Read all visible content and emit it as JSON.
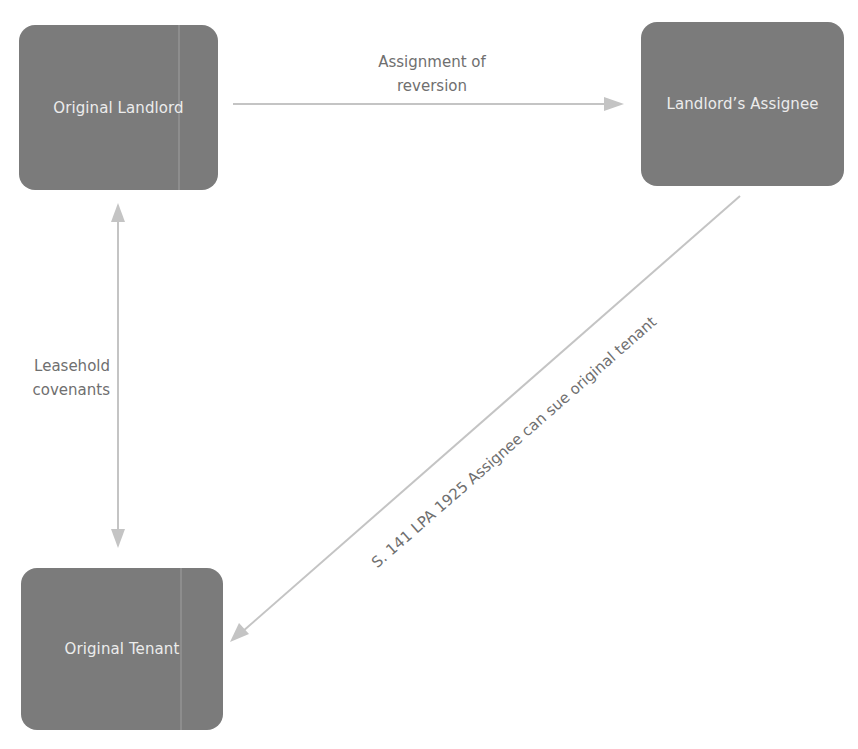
{
  "diagram": {
    "nodes": [
      {
        "id": "original-landlord",
        "label": "Original Landlord"
      },
      {
        "id": "landlords-assignee",
        "label": "Landlord’s Assignee"
      },
      {
        "id": "original-tenant",
        "label": "Original Tenant"
      }
    ],
    "edges": [
      {
        "from": "original-landlord",
        "to": "landlords-assignee",
        "label_lines": [
          "Assignment of",
          "reversion"
        ],
        "direction": "one-way"
      },
      {
        "from": "original-landlord",
        "to": "original-tenant",
        "label_lines": [
          "Leasehold",
          "covenants"
        ],
        "direction": "two-way"
      },
      {
        "from": "landlords-assignee",
        "to": "original-tenant",
        "label": "S. 141 LPA 1925 Assignee can sue original tenant",
        "direction": "one-way"
      }
    ],
    "colors": {
      "node_fill": "#7b7b7b",
      "node_text": "#ececec",
      "arrow": "#c4c4c4",
      "edge_label_text": "#6f6f6f"
    }
  }
}
